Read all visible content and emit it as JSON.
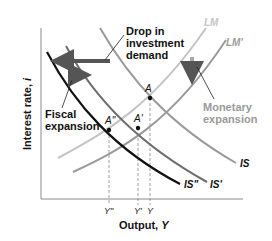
{
  "diagram": {
    "type": "IS-LM diagram",
    "axes": {
      "y_label": "Interest rate, ",
      "y_var": "i",
      "x_label": "Output, ",
      "x_var": "Y"
    },
    "curves": {
      "LM": {
        "label": "LM",
        "color": "#c4c4c4"
      },
      "LM_prime": {
        "label": "LM'",
        "color": "#9a9a9a"
      },
      "IS": {
        "label": "IS",
        "color": "#9a9a9a"
      },
      "IS_prime": {
        "label": "IS'",
        "color": "#6e6e6e"
      },
      "IS_double_prime": {
        "label": "IS\"",
        "color": "#111111"
      }
    },
    "points": {
      "A": "A",
      "A_prime": "A'",
      "A_double_prime": "A\""
    },
    "x_ticks": {
      "Y_double_prime": "Y\"",
      "Y_prime": "Y'",
      "Y": "Y"
    },
    "annotations": {
      "drop_investment": [
        "Drop in",
        "investment",
        "demand"
      ],
      "fiscal_expansion": [
        "Fiscal",
        "expansion"
      ],
      "monetary_expansion": [
        "Monetary",
        "expansion"
      ]
    },
    "colors": {
      "axis": "#8a8a8a",
      "text_dark": "#111111",
      "text_gray": "#9a9a9a",
      "arrow_dark": "#555555",
      "arrow_light": "#a8a8a8"
    }
  }
}
